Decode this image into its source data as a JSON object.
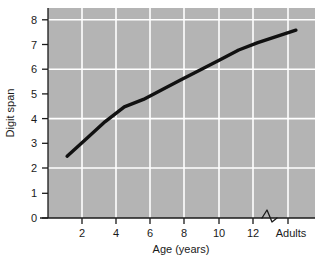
{
  "chart_data": {
    "type": "line",
    "title": "",
    "xlabel": "Age (years)",
    "ylabel": "Digit span",
    "x": [
      2,
      5,
      6,
      8,
      10,
      12,
      14
    ],
    "values": [
      2.5,
      4.5,
      4.8,
      5.6,
      6.4,
      7.1,
      7.6
    ],
    "categories": [
      "2",
      "4",
      "6",
      "8",
      "10",
      "12",
      "Adults"
    ],
    "series": [
      {
        "name": "Digit span",
        "points": [
          {
            "x": 2,
            "y": 2.5
          },
          {
            "x": 3,
            "y": 3.2
          },
          {
            "x": 4,
            "y": 3.9
          },
          {
            "x": 5,
            "y": 4.5
          },
          {
            "x": 6,
            "y": 4.8
          },
          {
            "x": 7,
            "y": 5.2
          },
          {
            "x": 8,
            "y": 5.6
          },
          {
            "x": 9,
            "y": 6.0
          },
          {
            "x": 10,
            "y": 6.4
          },
          {
            "x": 11,
            "y": 6.8
          },
          {
            "x": 12,
            "y": 7.1
          },
          {
            "x": 14,
            "y": 7.6
          }
        ],
        "color": "#111111"
      }
    ],
    "xticks": [
      "2",
      "4",
      "6",
      "8",
      "10",
      "12",
      "Adults"
    ],
    "xtick_values": [
      2,
      4,
      6,
      8,
      10,
      12,
      14
    ],
    "yticks": [
      "0",
      "1",
      "2",
      "3",
      "4",
      "5",
      "6",
      "7",
      "8"
    ],
    "ytick_values": [
      0,
      1,
      2,
      3,
      4,
      5,
      6,
      7,
      8
    ],
    "xlim": [
      1,
      15
    ],
    "ylim": [
      0,
      8.5
    ],
    "grid": true,
    "gridlines_y": [
      2,
      4,
      6,
      8
    ],
    "gridlines_x": [
      2,
      4,
      6,
      8,
      10,
      12,
      14
    ],
    "legend": null,
    "axis_break": {
      "present": true,
      "between": [
        "12",
        "Adults"
      ],
      "symbol": "zigzag"
    },
    "plot_background": "#b4b4b4",
    "gridline_color": "#ffffff",
    "axis_color": "#1a1a1a",
    "line_color": "#111111"
  }
}
